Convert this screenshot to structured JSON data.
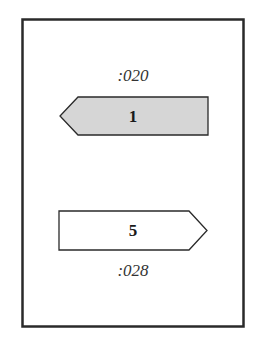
{
  "diagram": {
    "frame": {
      "stroke": "#2a2a2a"
    },
    "top": {
      "label": ":020",
      "arrow": {
        "number": "1",
        "direction": "left",
        "fill": "#d6d6d6",
        "stroke": "#2a2a2a"
      }
    },
    "bottom": {
      "label": ":028",
      "arrow": {
        "number": "5",
        "direction": "right",
        "fill": "#ffffff",
        "stroke": "#2a2a2a"
      }
    }
  }
}
